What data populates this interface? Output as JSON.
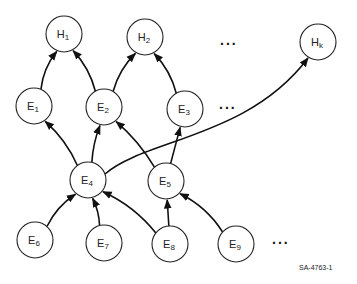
{
  "diagram": {
    "nodes": [
      {
        "id": "H1",
        "base": "H",
        "sub": "1"
      },
      {
        "id": "H2",
        "base": "H",
        "sub": "2"
      },
      {
        "id": "Hk",
        "base": "H",
        "sub": "k"
      },
      {
        "id": "E1",
        "base": "E",
        "sub": "1"
      },
      {
        "id": "E2",
        "base": "E",
        "sub": "2"
      },
      {
        "id": "E3",
        "base": "E",
        "sub": "3"
      },
      {
        "id": "E4",
        "base": "E",
        "sub": "4"
      },
      {
        "id": "E5",
        "base": "E",
        "sub": "5"
      },
      {
        "id": "E6",
        "base": "E",
        "sub": "6"
      },
      {
        "id": "E7",
        "base": "E",
        "sub": "7"
      },
      {
        "id": "E8",
        "base": "E",
        "sub": "8"
      },
      {
        "id": "E9",
        "base": "E",
        "sub": "9"
      }
    ],
    "edges": [
      {
        "from": "E1",
        "to": "H1"
      },
      {
        "from": "E2",
        "to": "H1"
      },
      {
        "from": "E2",
        "to": "H2"
      },
      {
        "from": "E3",
        "to": "H2"
      },
      {
        "from": "E4",
        "to": "E1"
      },
      {
        "from": "E4",
        "to": "E2"
      },
      {
        "from": "E4",
        "to": "Hk"
      },
      {
        "from": "E5",
        "to": "E2"
      },
      {
        "from": "E5",
        "to": "E3"
      },
      {
        "from": "E6",
        "to": "E4"
      },
      {
        "from": "E7",
        "to": "E4"
      },
      {
        "from": "E8",
        "to": "E4"
      },
      {
        "from": "E8",
        "to": "E5"
      },
      {
        "from": "E9",
        "to": "E5"
      }
    ],
    "ellipses": [
      "...",
      "...",
      "..."
    ],
    "figure_label": "SA-4763-1"
  }
}
